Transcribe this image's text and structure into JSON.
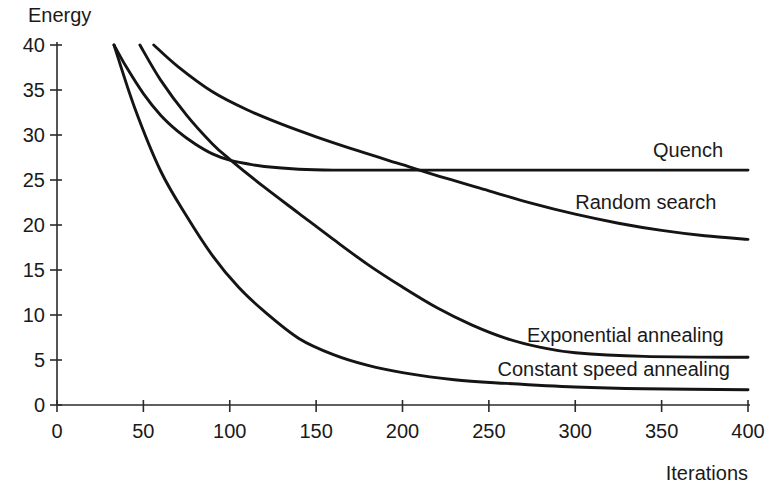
{
  "chart_data": {
    "type": "line",
    "title": "",
    "xlabel": "Iterations",
    "ylabel": "Energy",
    "xlim": [
      0,
      400
    ],
    "ylim": [
      0,
      40
    ],
    "grid": false,
    "legend_position": "inline-right",
    "x_ticks": [
      "0",
      "50",
      "100",
      "150",
      "200",
      "250",
      "300",
      "350",
      "400"
    ],
    "x_tick_values": [
      0,
      50,
      100,
      150,
      200,
      250,
      300,
      350,
      400
    ],
    "y_ticks": [
      "0",
      "5",
      "10",
      "15",
      "20",
      "25",
      "30",
      "35",
      "40"
    ],
    "y_tick_values": [
      0,
      5,
      10,
      15,
      20,
      25,
      30,
      35,
      40
    ],
    "series": [
      {
        "name": "Quench",
        "label": "Quench",
        "color": "#141414",
        "x": [
          33,
          40,
          50,
          60,
          70,
          80,
          90,
          100,
          110,
          120,
          140,
          160,
          200,
          250,
          300,
          350,
          400
        ],
        "values": [
          40.0,
          37.6,
          34.6,
          32.2,
          30.4,
          29.0,
          27.9,
          27.2,
          26.8,
          26.5,
          26.2,
          26.1,
          26.1,
          26.1,
          26.1,
          26.1,
          26.1
        ]
      },
      {
        "name": "Random search",
        "label": "Random search",
        "color": "#141414",
        "x": [
          56,
          70,
          90,
          110,
          130,
          150,
          175,
          200,
          225,
          250,
          275,
          300,
          325,
          350,
          375,
          400
        ],
        "values": [
          40.0,
          37.6,
          34.8,
          32.8,
          31.2,
          29.8,
          28.2,
          26.7,
          25.2,
          23.8,
          22.4,
          21.2,
          20.2,
          19.4,
          18.8,
          18.4
        ]
      },
      {
        "name": "Exponential annealing",
        "label": "Exponential annealing",
        "color": "#141414",
        "x": [
          48,
          60,
          75,
          90,
          100,
          120,
          140,
          160,
          180,
          200,
          220,
          240,
          260,
          280,
          300,
          340,
          400
        ],
        "values": [
          40.0,
          36.1,
          32.2,
          29.0,
          27.3,
          24.2,
          21.3,
          18.4,
          15.6,
          13.1,
          10.8,
          8.9,
          7.4,
          6.4,
          5.8,
          5.4,
          5.3
        ]
      },
      {
        "name": "Constant speed annealing",
        "label": "Constant speed annealing",
        "color": "#141414",
        "x": [
          33,
          45,
          60,
          75,
          90,
          105,
          120,
          140,
          160,
          180,
          200,
          230,
          260,
          300,
          340,
          400
        ],
        "values": [
          40.0,
          33.0,
          26.0,
          21.0,
          16.6,
          13.1,
          10.4,
          7.4,
          5.6,
          4.4,
          3.6,
          2.8,
          2.4,
          2.0,
          1.8,
          1.7
        ]
      }
    ],
    "annotations": [
      {
        "text": "Quench",
        "x": 345,
        "y": 27.6
      },
      {
        "text": "Random search",
        "x": 300,
        "y": 21.8
      },
      {
        "text": "Exponential annealing",
        "x": 272,
        "y": 7.0
      },
      {
        "text": "Constant speed annealing",
        "x": 255,
        "y": 3.2
      }
    ]
  }
}
